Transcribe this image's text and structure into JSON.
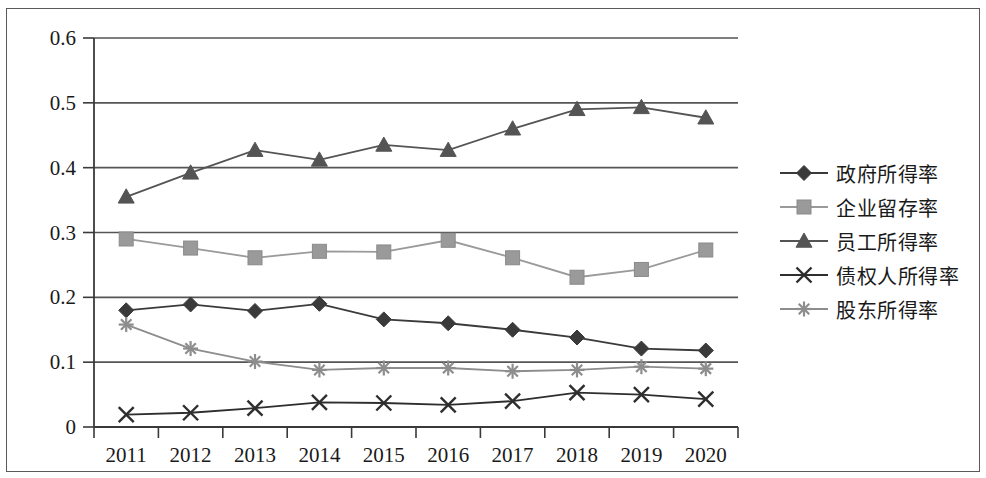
{
  "chart_data": {
    "type": "line",
    "title": "",
    "xlabel": "",
    "ylabel": "",
    "categories": [
      "2011",
      "2012",
      "2013",
      "2014",
      "2015",
      "2016",
      "2017",
      "2018",
      "2019",
      "2020"
    ],
    "ylim": [
      0,
      0.6
    ],
    "yticks": [
      "0",
      "0.1",
      "0.2",
      "0.3",
      "0.4",
      "0.5",
      "0.6"
    ],
    "ytick_values": [
      0,
      0.1,
      0.2,
      0.3,
      0.4,
      0.5,
      0.6
    ],
    "grid": "horizontal",
    "legend_position": "right",
    "series": [
      {
        "name": "政府所得率",
        "marker": "diamond",
        "color": "#3a3a3a",
        "values": [
          0.18,
          0.189,
          0.179,
          0.19,
          0.166,
          0.16,
          0.15,
          0.138,
          0.121,
          0.118
        ]
      },
      {
        "name": "企业留存率",
        "marker": "square",
        "color": "#9a9a9a",
        "values": [
          0.29,
          0.276,
          0.261,
          0.271,
          0.27,
          0.288,
          0.261,
          0.231,
          0.243,
          0.273
        ]
      },
      {
        "name": "员工所得率",
        "marker": "triangle",
        "color": "#545454",
        "values": [
          0.355,
          0.392,
          0.427,
          0.412,
          0.435,
          0.427,
          0.46,
          0.49,
          0.493,
          0.477
        ]
      },
      {
        "name": "债权人所得率",
        "marker": "cross",
        "color": "#2e2e2e",
        "values": [
          0.019,
          0.022,
          0.029,
          0.038,
          0.037,
          0.034,
          0.04,
          0.053,
          0.05,
          0.043
        ]
      },
      {
        "name": "股东所得率",
        "marker": "asterisk",
        "color": "#8d8d8d",
        "values": [
          0.158,
          0.121,
          0.101,
          0.088,
          0.091,
          0.091,
          0.086,
          0.088,
          0.093,
          0.09
        ]
      }
    ]
  },
  "legend": {
    "items": [
      {
        "label": "政府所得率"
      },
      {
        "label": "企业留存率"
      },
      {
        "label": "员工所得率"
      },
      {
        "label": "债权人所得率"
      },
      {
        "label": "股东所得率"
      }
    ]
  }
}
